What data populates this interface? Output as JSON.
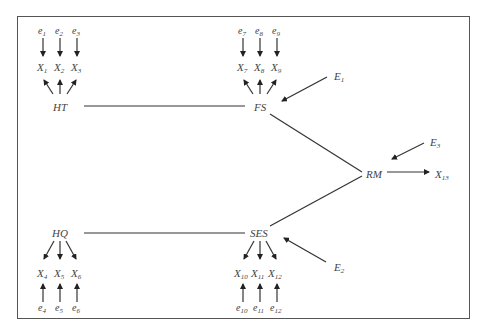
{
  "diagram": {
    "type": "structural-equation-path-diagram",
    "latent_nodes": [
      {
        "id": "HT",
        "label": "HT"
      },
      {
        "id": "FS",
        "label": "FS"
      },
      {
        "id": "HQ",
        "label": "HQ"
      },
      {
        "id": "SES",
        "label": "SES"
      },
      {
        "id": "RM",
        "label": "RM"
      }
    ],
    "indicators": {
      "HT": [
        "X1",
        "X2",
        "X3"
      ],
      "FS": [
        "X7",
        "X8",
        "X9"
      ],
      "HQ": [
        "X4",
        "X5",
        "X6"
      ],
      "SES": [
        "X10",
        "X11",
        "X12"
      ],
      "RM": [
        "X13"
      ]
    },
    "errors": {
      "X1": "e1",
      "X2": "e2",
      "X3": "e3",
      "X4": "e4",
      "X5": "e5",
      "X6": "e6",
      "X7": "e7",
      "X8": "e8",
      "X9": "e9",
      "X10": "e10",
      "X11": "e11",
      "X12": "e12"
    },
    "disturbances": {
      "FS": "E1",
      "SES": "E2",
      "RM": "E3"
    },
    "edges": [
      {
        "from": "HT",
        "to": "FS",
        "style": "line"
      },
      {
        "from": "HQ",
        "to": "SES",
        "style": "line"
      },
      {
        "from": "FS",
        "to": "RM",
        "style": "line"
      },
      {
        "from": "SES",
        "to": "RM",
        "style": "line"
      },
      {
        "from": "RM",
        "to": "X13",
        "style": "arrow"
      }
    ]
  },
  "labels": {
    "HT": "HT",
    "FS": "FS",
    "HQ": "HQ",
    "SES": "SES",
    "RM": "RM",
    "X": "X",
    "e": "e",
    "E": "E",
    "x1": "1",
    "x2": "2",
    "x3": "3",
    "x4": "4",
    "x5": "5",
    "x6": "6",
    "x7": "7",
    "x8": "8",
    "x9": "9",
    "x10": "10",
    "x11": "11",
    "x12": "12",
    "x13": "13",
    "E1": "1",
    "E2": "2",
    "E3": "3"
  }
}
